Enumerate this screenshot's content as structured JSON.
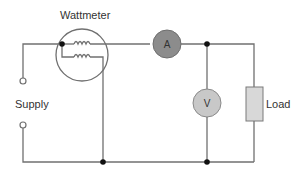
{
  "diagram": {
    "labels": {
      "wattmeter": "Wattmeter",
      "supply": "Supply",
      "load": "Load",
      "ammeter": "A",
      "voltmeter": "V"
    },
    "colors": {
      "wire": "#707070",
      "ammeter_fill": "#8c8c8c",
      "voltmeter_fill": "#c8c8c8",
      "load_fill": "#d8d8d8",
      "junction": "#111111"
    }
  }
}
